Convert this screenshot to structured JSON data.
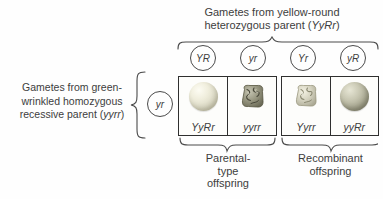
{
  "top_header": {
    "line1": "Gametes from yellow-round",
    "line2_prefix": "heterozygous parent (",
    "line2_gene": "YyRr",
    "line2_suffix": ")"
  },
  "top_gametes": [
    {
      "label": "YR"
    },
    {
      "label": "yr"
    },
    {
      "label": "Yr"
    },
    {
      "label": "yR"
    }
  ],
  "left_label": {
    "line1": "Gametes from green-",
    "line2": "wrinkled homozygous",
    "line3_prefix": "recessive parent (",
    "line3_gene": "yyrr",
    "line3_suffix": ")"
  },
  "left_gamete": {
    "label": "yr"
  },
  "offspring_cells": [
    {
      "genotype": "YyRr",
      "pea_icon": "round-yellow-pea"
    },
    {
      "genotype": "yyrr",
      "pea_icon": "wrinkled-green-pea"
    },
    {
      "genotype": "Yyrr",
      "pea_icon": "wrinkled-yellow-pea"
    },
    {
      "genotype": "yyRr",
      "pea_icon": "round-green-pea"
    }
  ],
  "bottom_groups": [
    {
      "line1": "Parental-",
      "line2": "type",
      "line3": "offspring"
    },
    {
      "line1": "Recombinant",
      "line2": "offspring"
    }
  ],
  "colors": {
    "text": "#3d3d3d",
    "line": "#4a4a4a",
    "pea_yellow": "#e9e7d6",
    "pea_green": "#8f8e7a",
    "background": "#fefefe"
  }
}
